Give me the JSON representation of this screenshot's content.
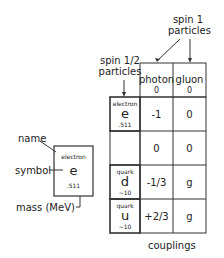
{
  "labels": {
    "spin1_line1": "spin 1",
    "spin1_line2": "particles",
    "spinhalf_line1": "spin 1/2",
    "spinhalf_line2": "particles",
    "couplings": "couplings"
  },
  "columns": [
    {
      "name": "photon",
      "mass": "0"
    },
    {
      "name": "gluon",
      "mass": "0"
    }
  ],
  "rows": [
    {
      "name": "electron",
      "symbol": "e",
      "mass": ".511",
      "couplings": [
        "-1",
        "0"
      ]
    },
    {
      "name": "",
      "symbol": "",
      "mass": "",
      "couplings": [
        "0",
        "0"
      ]
    },
    {
      "name": "quark",
      "symbol": "d",
      "mass": "~10",
      "couplings": [
        "-1/3",
        "g"
      ]
    },
    {
      "name": "quark",
      "symbol": "u",
      "mass": "~10",
      "couplings": [
        "+2/3",
        "g"
      ]
    }
  ],
  "legend": {
    "name_label": "name",
    "symbol_label": "symbol",
    "mass_label": "mass (MeV)",
    "example_name": "electron",
    "example_symbol": "e",
    "example_mass": ".511"
  }
}
